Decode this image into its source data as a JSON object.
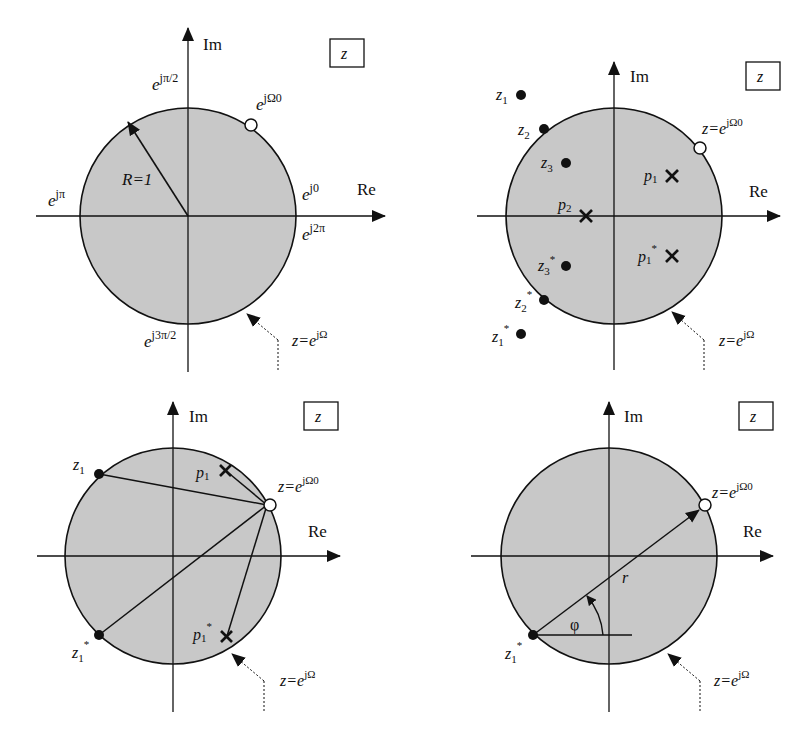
{
  "colors": {
    "disk_fill": "#c8c8c8",
    "stroke": "#111111",
    "background": "#ffffff"
  },
  "common": {
    "axis_re": "Re",
    "axis_im": "Im",
    "plane_label": "z",
    "unit_circle_label": "z=e",
    "unit_circle_sup": "jΩ",
    "point_label": "z=e",
    "point_sup": "jΩ0"
  },
  "panel1": {
    "radius_label": "R=1",
    "e": "e",
    "sup_pi2": "jπ/2",
    "sup_w0": "jΩ0",
    "sup_pi": "jπ",
    "sup_0": "j0",
    "sup_2pi": "j2π",
    "sup_3pi2": "j3π/2"
  },
  "panel2": {
    "zeros": [
      {
        "name": "z",
        "sub": "1",
        "sup": ""
      },
      {
        "name": "z",
        "sub": "2",
        "sup": ""
      },
      {
        "name": "z",
        "sub": "3",
        "sup": ""
      },
      {
        "name": "z",
        "sub": "3",
        "sup": "*"
      },
      {
        "name": "z",
        "sub": "2",
        "sup": "*"
      },
      {
        "name": "z",
        "sub": "1",
        "sup": "*"
      }
    ],
    "poles": [
      {
        "name": "p",
        "sub": "1",
        "sup": ""
      },
      {
        "name": "p",
        "sub": "2",
        "sup": ""
      },
      {
        "name": "p",
        "sub": "1",
        "sup": "*"
      }
    ]
  },
  "panel3": {
    "zeros": [
      {
        "name": "z",
        "sub": "1",
        "sup": ""
      },
      {
        "name": "z",
        "sub": "1",
        "sup": "*"
      }
    ],
    "poles": [
      {
        "name": "p",
        "sub": "1",
        "sup": ""
      },
      {
        "name": "p",
        "sub": "1",
        "sup": "*"
      }
    ]
  },
  "panel4": {
    "zero": {
      "name": "z",
      "sub": "1",
      "sup": "*"
    },
    "distance_label": "r",
    "angle_label": "φ"
  }
}
